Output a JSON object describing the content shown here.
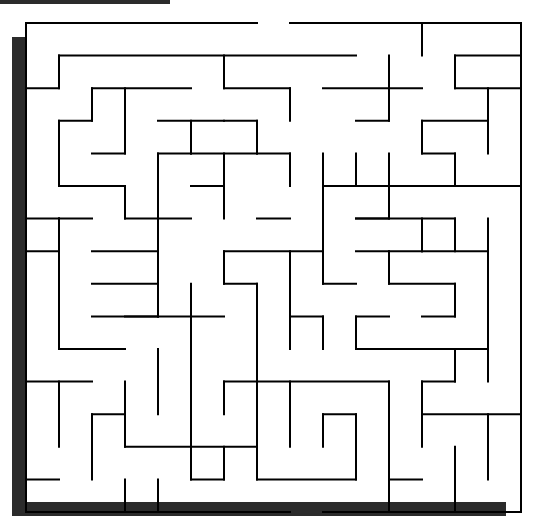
{
  "maze": {
    "cols": 15,
    "rows": 15,
    "origin": [
      26,
      23
    ],
    "cell_w": 33.0,
    "cell_h": 32.6,
    "wall_color": "#000000",
    "shadow_color": "#2b2b2b",
    "entrance": {
      "side": "top",
      "between_cols": [
        7,
        8
      ]
    },
    "walls": [
      [
        0,
        0,
        7,
        0
      ],
      [
        8,
        0,
        15,
        0
      ],
      [
        0,
        0,
        0,
        15
      ],
      [
        15,
        0,
        15,
        15
      ],
      [
        0,
        15,
        8,
        15
      ],
      [
        9,
        15,
        15,
        15
      ],
      [
        12,
        0,
        12,
        1
      ],
      [
        1,
        1,
        10,
        1
      ],
      [
        1,
        1,
        1,
        2
      ],
      [
        0,
        2,
        1,
        2
      ],
      [
        6,
        1,
        6,
        2
      ],
      [
        6,
        2,
        8,
        2
      ],
      [
        8,
        2,
        8,
        3
      ],
      [
        11,
        1,
        11,
        3
      ],
      [
        9,
        2,
        12,
        2
      ],
      [
        10,
        3,
        11,
        3
      ],
      [
        13,
        1,
        15,
        1
      ],
      [
        13,
        1,
        13,
        2
      ],
      [
        13,
        2,
        15,
        2
      ],
      [
        2,
        2,
        5,
        2
      ],
      [
        2,
        2,
        2,
        3
      ],
      [
        1,
        3,
        2,
        3
      ],
      [
        1,
        3,
        1,
        5
      ],
      [
        1,
        5,
        3,
        5
      ],
      [
        3,
        5,
        3,
        6
      ],
      [
        3,
        6,
        4,
        6
      ],
      [
        3,
        2,
        3,
        4
      ],
      [
        2,
        4,
        3,
        4
      ],
      [
        4,
        3,
        6,
        3
      ],
      [
        5,
        3,
        5,
        4
      ],
      [
        5,
        4,
        4,
        4
      ],
      [
        4,
        4,
        4,
        9
      ],
      [
        4,
        6,
        5,
        6
      ],
      [
        5,
        4,
        7,
        4
      ],
      [
        7,
        4,
        7,
        3
      ],
      [
        7,
        3,
        6,
        3
      ],
      [
        6,
        4,
        6,
        6
      ],
      [
        5,
        5,
        6,
        5
      ],
      [
        7,
        4,
        8,
        4
      ],
      [
        8,
        4,
        8,
        5
      ],
      [
        7,
        6,
        8,
        6
      ],
      [
        12,
        3,
        14,
        3
      ],
      [
        12,
        3,
        12,
        4
      ],
      [
        12,
        4,
        13,
        4
      ],
      [
        13,
        4,
        13,
        5
      ],
      [
        14,
        2,
        14,
        4
      ],
      [
        9,
        5,
        12,
        5
      ],
      [
        10,
        4,
        10,
        5
      ],
      [
        9,
        4,
        9,
        5
      ],
      [
        9,
        5,
        9,
        8
      ],
      [
        11,
        4,
        11,
        6
      ],
      [
        10,
        6,
        11,
        6
      ],
      [
        12,
        5,
        15,
        5
      ],
      [
        10,
        6,
        13,
        6
      ],
      [
        12,
        6,
        12,
        7
      ],
      [
        12,
        7,
        14,
        7
      ],
      [
        11,
        7,
        12,
        7
      ],
      [
        13,
        6,
        13,
        7
      ],
      [
        0,
        7,
        1,
        7
      ],
      [
        1,
        6,
        2,
        6
      ],
      [
        1,
        6,
        1,
        10
      ],
      [
        1,
        10,
        3,
        10
      ],
      [
        2,
        7,
        4,
        7
      ],
      [
        0,
        6,
        1,
        6
      ],
      [
        0,
        7,
        0,
        7
      ],
      [
        2,
        8,
        4,
        8
      ],
      [
        4,
        8,
        4,
        9
      ],
      [
        2,
        9,
        6,
        9
      ],
      [
        5,
        8,
        5,
        9
      ],
      [
        5,
        9,
        5,
        13
      ],
      [
        6,
        7,
        9,
        7
      ],
      [
        6,
        7,
        6,
        8
      ],
      [
        6,
        8,
        7,
        8
      ],
      [
        8,
        7,
        8,
        8
      ],
      [
        7,
        8,
        7,
        13
      ],
      [
        9,
        8,
        10,
        8
      ],
      [
        10,
        7,
        11,
        7
      ],
      [
        11,
        7,
        11,
        8
      ],
      [
        11,
        8,
        13,
        8
      ],
      [
        13,
        8,
        13,
        9
      ],
      [
        12,
        9,
        13,
        9
      ],
      [
        14,
        6,
        14,
        11
      ],
      [
        13,
        10,
        14,
        10
      ],
      [
        13,
        10,
        13,
        11
      ],
      [
        12,
        11,
        13,
        11
      ],
      [
        8,
        8,
        8,
        10
      ],
      [
        8,
        9,
        9,
        9
      ],
      [
        9,
        9,
        9,
        10
      ],
      [
        10,
        9,
        11,
        9
      ],
      [
        10,
        9,
        10,
        10
      ],
      [
        10,
        10,
        13,
        10
      ],
      [
        3,
        9,
        4,
        9
      ],
      [
        4,
        10,
        4,
        11
      ],
      [
        0,
        11,
        2,
        11
      ],
      [
        1,
        11,
        1,
        13
      ],
      [
        3,
        11,
        3,
        13
      ],
      [
        4,
        11,
        4,
        12
      ],
      [
        2,
        12,
        3,
        12
      ],
      [
        2,
        12,
        2,
        14
      ],
      [
        3,
        13,
        7,
        13
      ],
      [
        7,
        11,
        7,
        14
      ],
      [
        6,
        11,
        11,
        11
      ],
      [
        6,
        11,
        6,
        12
      ],
      [
        8,
        11,
        8,
        13
      ],
      [
        9,
        12,
        10,
        12
      ],
      [
        9,
        12,
        9,
        13
      ],
      [
        10,
        12,
        10,
        14
      ],
      [
        7,
        14,
        10,
        14
      ],
      [
        11,
        11,
        11,
        15
      ],
      [
        11,
        14,
        12,
        14
      ],
      [
        12,
        11,
        12,
        13
      ],
      [
        12,
        12,
        15,
        12
      ],
      [
        13,
        13,
        13,
        15
      ],
      [
        14,
        12,
        14,
        14
      ],
      [
        3,
        14,
        3,
        15
      ],
      [
        4,
        14,
        4,
        15
      ],
      [
        0,
        14,
        1,
        14
      ],
      [
        5,
        14,
        6,
        14
      ],
      [
        6,
        13,
        6,
        14
      ],
      [
        5,
        13,
        5,
        14
      ]
    ]
  }
}
